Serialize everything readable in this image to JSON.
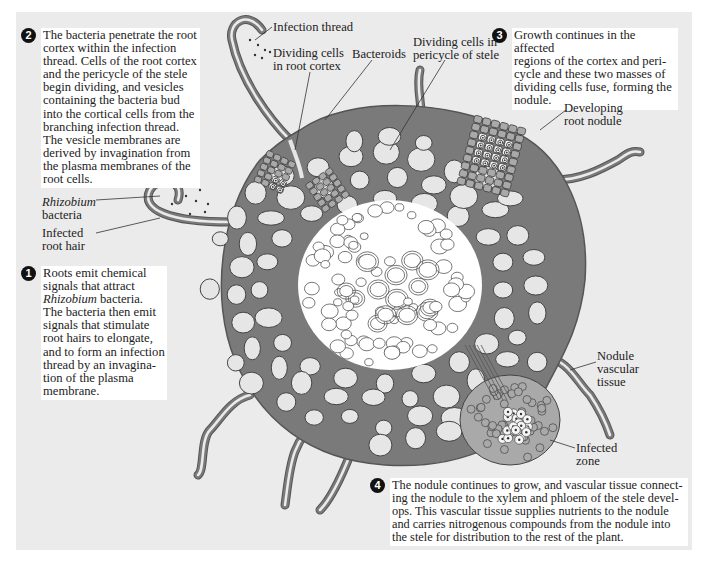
{
  "figure": {
    "background_color": "#ebebeb",
    "tissue_color": "#7a7a7a",
    "cell_color": "#e6e6e6",
    "stele_color": "#ffffff",
    "dividing_cell_color": "#a9a9a9"
  },
  "steps": [
    {
      "number": "1",
      "text_parts": [
        {
          "t": "Roots emit chemical signals that attract ",
          "italic": false
        },
        {
          "t": "Rhizobium",
          "italic": true
        },
        {
          "t": " bacteria. The bacteria then emit signals that stimulate root hairs to elongate, and to form an infection thread by an invagina-tion of the plasma membrane.",
          "italic": false
        }
      ],
      "lines": [
        "Roots emit chemical",
        "signals that attract",
        "Rhizobium bacteria.",
        "The bacteria then emit",
        "signals that stimulate",
        "root hairs to elongate,",
        "and to form an infection",
        "thread by an invagina-",
        "tion of the plasma",
        "membrane."
      ]
    },
    {
      "number": "2",
      "lines": [
        "The bacteria penetrate the root",
        "cortex within the infection",
        "thread. Cells of the root cortex",
        "and the pericycle of the stele",
        "begin dividing, and vesicles",
        "containing the bacteria bud",
        "into the cortical cells from the",
        "branching infection thread.",
        "The vesicle membranes are",
        "derived by invagination from",
        "the plasma membranes of the",
        "root cells."
      ]
    },
    {
      "number": "3",
      "lines": [
        "Growth continues in the affected",
        "regions of the cortex and peri-",
        "cycle and these two masses of",
        "dividing cells fuse, forming the",
        "nodule."
      ]
    },
    {
      "number": "4",
      "lines": [
        "The nodule continues to grow, and vascular tissue connect-",
        "ing the nodule to the xylem and phloem of the stele devel-",
        "ops. This vascular tissue supplies nutrients to the nodule",
        "and carries nitrogenous compounds from the nodule into",
        "the stele for distribution to the rest of the plant."
      ]
    }
  ],
  "labels": {
    "infection_thread": "Infection thread",
    "dividing_cortex": [
      "Dividing cells",
      "in root cortex"
    ],
    "bacteroids": "Bacteroids",
    "dividing_pericycle": [
      "Dividing cells in",
      "pericycle of stele"
    ],
    "developing_nodule": [
      "Developing",
      "root nodule"
    ],
    "rhizobium": [
      "Rhizobium",
      "bacteria"
    ],
    "infected_root_hair": [
      "Infected",
      "root hair"
    ],
    "nodule_vascular": [
      "Nodule",
      "vascular",
      "tissue"
    ],
    "infected_zone": [
      "Infected",
      "zone"
    ]
  }
}
